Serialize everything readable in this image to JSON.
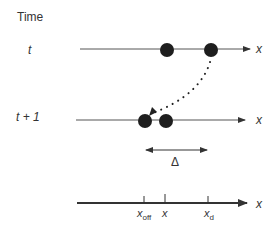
{
  "diagram": {
    "time_label": "Time",
    "rows": [
      {
        "label": "t",
        "axis_label": "x"
      },
      {
        "label": "t + 1",
        "axis_label": "x"
      }
    ],
    "delta_label": "Δ",
    "bottom_axis": {
      "axis_label": "x",
      "ticks": [
        {
          "main": "x",
          "sub": "off"
        },
        {
          "main": "x",
          "sub": ""
        },
        {
          "main": "x",
          "sub": "d"
        }
      ]
    },
    "colors": {
      "line": "#555555",
      "dot": "#1e1e1e",
      "text": "#333333"
    }
  }
}
